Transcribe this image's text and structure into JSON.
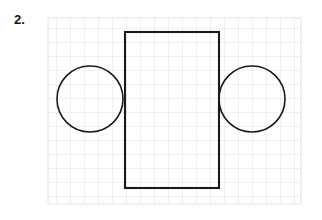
{
  "page": {
    "background_color": "#ffffff",
    "width": 322,
    "height": 220
  },
  "label": {
    "text": "2.",
    "color": "#151515",
    "x": 14,
    "y": 13
  },
  "grid": {
    "x": 48,
    "y": 18,
    "width": 253,
    "height": 186,
    "cell_size": 14,
    "columns": 18,
    "rows": 13,
    "line_color": "#e3e3e3",
    "line_width": 1,
    "border_color": "#e3e3e3"
  },
  "figure": {
    "stroke_color": "#1a1a1a",
    "fill": "none",
    "shapes": [
      {
        "name": "left-circle",
        "type": "circle",
        "cx": 90,
        "cy": 99,
        "r": 33,
        "stroke_width": 1.6
      },
      {
        "name": "right-circle",
        "type": "circle",
        "cx": 252,
        "cy": 99,
        "r": 33,
        "stroke_width": 1.6
      },
      {
        "name": "center-rectangle",
        "type": "rect",
        "x": 125,
        "y": 32,
        "width": 94,
        "height": 156,
        "stroke_width": 2.1
      }
    ]
  }
}
